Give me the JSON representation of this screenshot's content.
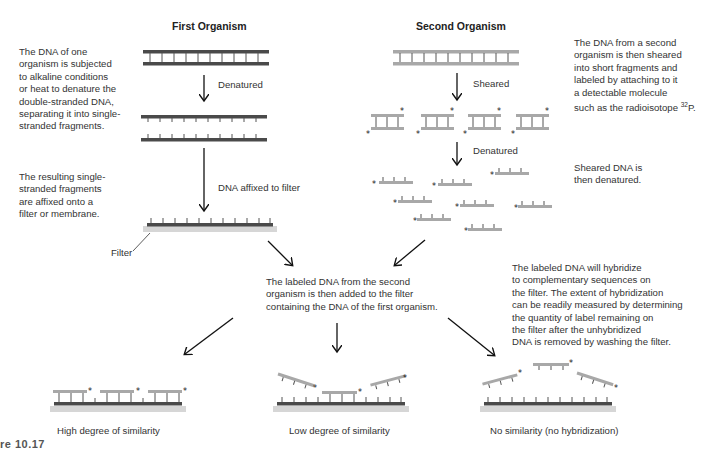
{
  "columns": {
    "first": "First Organism",
    "second": "Second Organism"
  },
  "descriptions": {
    "step1_first": "The DNA of one\norganism is subjected\nto alkaline conditions\nor heat to denature the\ndouble-stranded DNA,\nseparating it into single-\nstranded fragments.",
    "step2_first": "The resulting single-\nstranded fragments\nare affixed onto a\nfilter or membrane.",
    "step1_second": "The DNA from a second\norganism is then sheared\ninto short fragments and\nlabeled by attaching to it\na detectable molecule\nsuch as the radioisotope ",
    "step1_second_isotope_mass": "32",
    "step1_second_isotope_symbol": "P.",
    "step2_second": "Sheared DNA is\nthen denatured.",
    "combine": "The labeled DNA from the second\norganism is then added to the filter\ncontaining the DNA of the first organism.",
    "hybridize": "The labeled DNA will hybridize\nto complementary sequences on\nthe filter. The extent of hybridization\ncan be readily measured by determining\nthe quantity of label remaining on\nthe filter after the unhybridized\nDNA is removed by washing the filter."
  },
  "arrow_labels": {
    "denatured_first": "Denatured",
    "affixed": "DNA affixed to filter",
    "sheared": "Sheared",
    "denatured_second": "Denatured"
  },
  "filter_label": "Filter",
  "outcomes": [
    {
      "label": "High degree of similarity"
    },
    {
      "label": "Low degree of similarity"
    },
    {
      "label": "No similarity (no hybridization)"
    }
  ],
  "caption_fragment": "re 10.17",
  "colors": {
    "dark_strand": "#4a4a4a",
    "light_strand": "#a8a8a8",
    "filter": "#d6d6d6",
    "text": "#333333"
  }
}
